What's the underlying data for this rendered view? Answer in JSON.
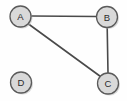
{
  "diagram": {
    "background_color": "#fefefe",
    "node_fill": "#d9d9d9",
    "node_stroke": "#5a5a5a",
    "edge_color": "#4a4a4a",
    "label_color": "#2b2b2b",
    "nodes": [
      {
        "id": "A",
        "label": "A",
        "cx": 20.5,
        "cy": 16.5,
        "r": 10.5
      },
      {
        "id": "B",
        "label": "B",
        "cx": 107.0,
        "cy": 17.0,
        "r": 10.5
      },
      {
        "id": "C",
        "label": "C",
        "cx": 108.0,
        "cy": 83.5,
        "r": 10.5
      },
      {
        "id": "D",
        "label": "D",
        "cx": 21.0,
        "cy": 82.5,
        "r": 10.5
      }
    ],
    "edges": [
      {
        "id": "edge-a-b",
        "from": "A",
        "to": "B",
        "x1": 31.0,
        "y1": 16.0,
        "x2": 96.5,
        "y2": 16.5
      },
      {
        "id": "edge-b-c",
        "from": "B",
        "to": "C",
        "x1": 107.2,
        "y1": 27.5,
        "x2": 108.0,
        "y2": 73.0
      },
      {
        "id": "edge-a-c",
        "from": "A",
        "to": "C",
        "x1": 28.5,
        "y1": 24.0,
        "x2": 100.5,
        "y2": 76.5
      }
    ],
    "isolated_nodes": [
      "D"
    ],
    "edge_count": 3,
    "node_count": 4
  }
}
